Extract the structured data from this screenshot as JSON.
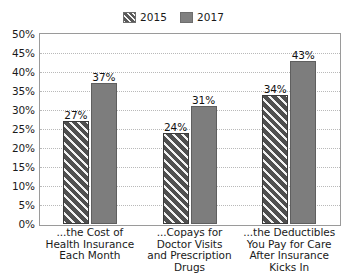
{
  "chart_data": {
    "type": "bar",
    "title": "",
    "subtitle": "",
    "xlabel": "",
    "ylabel": "",
    "ylim": [
      0,
      50
    ],
    "ytick_labels": [
      "0%",
      "5%",
      "10%",
      "15%",
      "20%",
      "25%",
      "30%",
      "35%",
      "40%",
      "45%",
      "50%"
    ],
    "ytick_values": [
      0,
      5,
      10,
      15,
      20,
      25,
      30,
      35,
      40,
      45,
      50
    ],
    "grid": "horizontal-dotted",
    "legend_position": "top-center",
    "categories": [
      "...the Cost of Health Insurance Each Month",
      "...Copays for Doctor Visits and Prescription Drugs",
      "...the Deductibles You Pay for Care After Insurance Kicks In"
    ],
    "category_lines": [
      [
        "...the Cost of",
        "Health Insurance",
        "Each Month"
      ],
      [
        "...Copays for",
        "Doctor Visits",
        "and Prescription",
        "Drugs"
      ],
      [
        "...the Deductibles",
        "You Pay for Care",
        "After Insurance",
        "Kicks In"
      ]
    ],
    "series": [
      {
        "name": "2015",
        "color": "#4f4f4f",
        "pattern": "diagonal-hatch",
        "values": [
          27,
          37,
          34
        ],
        "value_labels": [
          "27%",
          "24%",
          "34%"
        ]
      },
      {
        "name": "2017",
        "color": "#7d7d7d",
        "pattern": "solid",
        "values": [
          37,
          31,
          43
        ],
        "value_labels": [
          "37%",
          "31%",
          "43%"
        ]
      }
    ],
    "bar_values": [
      [
        {
          "series": "2015",
          "value": 27,
          "label": "27%"
        },
        {
          "series": "2017",
          "value": 37,
          "label": "37%"
        }
      ],
      [
        {
          "series": "2015",
          "value": 24,
          "label": "24%"
        },
        {
          "series": "2017",
          "value": 31,
          "label": "31%"
        }
      ],
      [
        {
          "series": "2015",
          "value": 34,
          "label": "34%"
        },
        {
          "series": "2017",
          "value": 43,
          "label": "43%"
        }
      ]
    ]
  },
  "legend": {
    "items": [
      {
        "label": "2015",
        "swatch": "hatched"
      },
      {
        "label": "2017",
        "swatch": "solid"
      }
    ]
  }
}
